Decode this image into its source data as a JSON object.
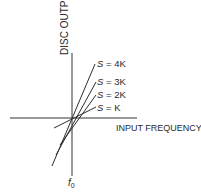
{
  "diagram": {
    "y_axis_label": "DISC OUTPUT",
    "x_axis_label": "INPUT FREQUENCY",
    "center_label": "f",
    "center_subscript": "0",
    "lines": [
      {
        "label_var": "S",
        "label_rest": " = 4K",
        "slope_multiplier": 4
      },
      {
        "label_var": "S",
        "label_rest": " = 3K",
        "slope_multiplier": 3
      },
      {
        "label_var": "S",
        "label_rest": " = 2K",
        "slope_multiplier": 2
      },
      {
        "label_var": "S",
        "label_rest": " = K",
        "slope_multiplier": 1
      }
    ],
    "colors": {
      "ink": "#2e2e2e",
      "background": "#ffffff"
    }
  }
}
